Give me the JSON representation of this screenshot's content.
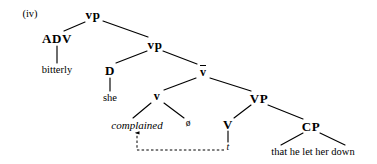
{
  "figure": {
    "example_label": "(iv)",
    "sentence": "that he let her down"
  },
  "tree": {
    "nodes": [
      {
        "id": "vp_top",
        "label": "vp",
        "kind": "category",
        "x": 93,
        "y": 14
      },
      {
        "id": "adv",
        "label": "ADV",
        "kind": "category",
        "x": 57,
        "y": 38
      },
      {
        "id": "bitterly",
        "label": "bitterly",
        "kind": "terminal",
        "x": 57,
        "y": 70
      },
      {
        "id": "vp_mid",
        "label": "vp",
        "kind": "category",
        "x": 155,
        "y": 44
      },
      {
        "id": "d",
        "label": "D",
        "kind": "category",
        "x": 110,
        "y": 70
      },
      {
        "id": "she",
        "label": "she",
        "kind": "terminal",
        "x": 110,
        "y": 98
      },
      {
        "id": "vbar",
        "label": "v",
        "kind": "bar",
        "x": 203,
        "y": 71
      },
      {
        "id": "v_small",
        "label": "v",
        "kind": "category-small",
        "x": 157,
        "y": 96
      },
      {
        "id": "complained",
        "label": "complained",
        "kind": "terminal-italic",
        "x": 137,
        "y": 125
      },
      {
        "id": "null_obj",
        "label": "ø",
        "kind": "null",
        "x": 188,
        "y": 124
      },
      {
        "id": "vp_big",
        "label": "VP",
        "kind": "category",
        "x": 259,
        "y": 98
      },
      {
        "id": "v_big",
        "label": "V",
        "kind": "category",
        "x": 228,
        "y": 124
      },
      {
        "id": "trace",
        "label": "t",
        "kind": "trace",
        "x": 228,
        "y": 147
      },
      {
        "id": "cp",
        "label": "CP",
        "kind": "category",
        "x": 311,
        "y": 126
      },
      {
        "id": "clause",
        "label": "that he let her down",
        "kind": "phrase",
        "x": 313,
        "y": 152
      }
    ],
    "branches": [
      {
        "from": "vp_top",
        "to": "adv",
        "x1": 85,
        "y1": 22,
        "x2": 64,
        "y2": 31
      },
      {
        "from": "adv",
        "to": "bitterly",
        "x1": 57,
        "y1": 46,
        "x2": 57,
        "y2": 63
      },
      {
        "from": "vp_top",
        "to": "vp_mid",
        "x1": 103,
        "y1": 21,
        "x2": 148,
        "y2": 37
      },
      {
        "from": "vp_mid",
        "to": "d",
        "x1": 147,
        "y1": 51,
        "x2": 116,
        "y2": 63
      },
      {
        "from": "d",
        "to": "she",
        "x1": 110,
        "y1": 78,
        "x2": 110,
        "y2": 91
      },
      {
        "from": "vp_mid",
        "to": "vbar",
        "x1": 163,
        "y1": 51,
        "x2": 197,
        "y2": 64
      },
      {
        "from": "vbar",
        "to": "v_small",
        "x1": 196,
        "y1": 78,
        "x2": 164,
        "y2": 90
      },
      {
        "from": "v_small",
        "to": "complained",
        "x1": 151,
        "y1": 103,
        "x2": 133,
        "y2": 118
      },
      {
        "from": "v_small",
        "to": "null_obj",
        "x1": 164,
        "y1": 103,
        "x2": 184,
        "y2": 118
      },
      {
        "from": "vbar",
        "to": "vp_big",
        "x1": 210,
        "y1": 78,
        "x2": 251,
        "y2": 91
      },
      {
        "from": "vp_big",
        "to": "v_big",
        "x1": 251,
        "y1": 105,
        "x2": 234,
        "y2": 118
      },
      {
        "from": "v_big",
        "to": "trace",
        "x1": 228,
        "y1": 131,
        "x2": 228,
        "y2": 142
      },
      {
        "from": "vp_big",
        "to": "cp",
        "x1": 268,
        "y1": 105,
        "x2": 303,
        "y2": 119
      },
      {
        "from": "cp",
        "to": "clause",
        "x1": 303,
        "y1": 133,
        "x2": 281,
        "y2": 145
      },
      {
        "from": "cp",
        "to": "clause2",
        "x1": 320,
        "y1": 133,
        "x2": 345,
        "y2": 145
      }
    ],
    "movement_arrow": {
      "label": "movement-from-trace-to-complained",
      "style": "dashed",
      "path": "M 224 150 L 137 150 L 137 133"
    }
  },
  "colors": {
    "ink": "#000000",
    "background": "#ffffff"
  }
}
